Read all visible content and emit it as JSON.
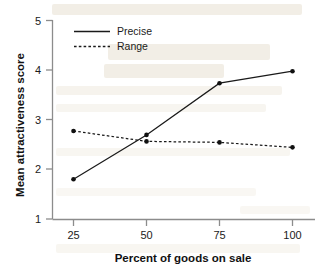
{
  "chart_data": {
    "type": "line",
    "title": "",
    "xlabel": "Percent of goods on sale",
    "ylabel": "Mean attractiveness score",
    "categories": [
      "25",
      "50",
      "75",
      "100"
    ],
    "x": [
      25,
      50,
      75,
      100
    ],
    "xlim": [
      25,
      100
    ],
    "ylim": [
      1,
      5
    ],
    "yticks": [
      "1",
      "2",
      "3",
      "4",
      "5"
    ],
    "xticks": [
      "25",
      "50",
      "75",
      "100"
    ],
    "grid": false,
    "legend_position": "top-left",
    "series": [
      {
        "name": "Precise",
        "style": "solid",
        "marker": "filled-circle",
        "color": "#1a1a1a",
        "values": [
          1.8,
          2.69,
          3.73,
          3.97
        ]
      },
      {
        "name": "Range",
        "style": "dashed",
        "marker": "filled-circle",
        "color": "#1a1a1a",
        "values": [
          2.77,
          2.56,
          2.54,
          2.44
        ]
      }
    ]
  },
  "axes": {
    "y_tick_labels": [
      "5",
      "4",
      "3",
      "2",
      "1"
    ],
    "x_tick_labels": [
      "25",
      "50",
      "75",
      "100"
    ],
    "y_axis_title": "Mean attractiveness score",
    "x_axis_title": "Percent of goods on sale"
  },
  "legend": {
    "items": [
      {
        "label": "Precise",
        "style": "solid"
      },
      {
        "label": "Range",
        "style": "dashed"
      }
    ]
  },
  "colors": {
    "axis": "#8c8c8c",
    "series": "#1a1a1a",
    "text": "#1b1b1b",
    "background": "#ffffff",
    "watermark": "#e8e0d2"
  }
}
